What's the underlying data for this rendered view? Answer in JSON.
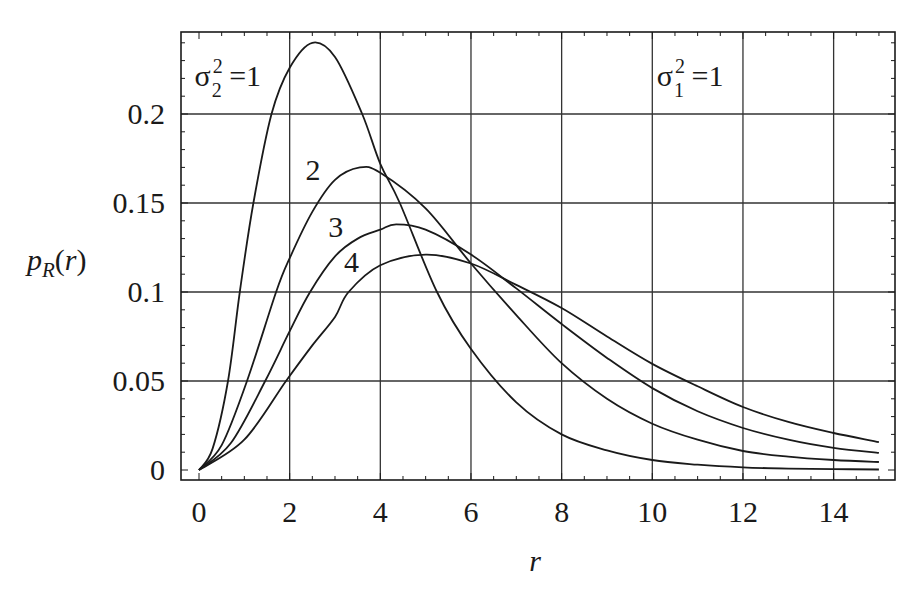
{
  "chart_data": {
    "type": "line",
    "title": "",
    "xlabel": "r",
    "ylabel": "p_R(r)",
    "ylabel_display": {
      "main": "p",
      "sub": "R",
      "suffix": "(r)"
    },
    "xlim": [
      -0.4,
      15.35
    ],
    "ylim": [
      -0.0056,
      0.246
    ],
    "grid": true,
    "legend": "none (inline curve labels)",
    "x_ticks": [
      0,
      2,
      4,
      6,
      8,
      10,
      12,
      14
    ],
    "x_tick_labels": [
      "0",
      "2",
      "4",
      "6",
      "8",
      "10",
      "12",
      "14"
    ],
    "y_ticks": [
      0,
      0.05,
      0.1,
      0.15,
      0.2
    ],
    "y_tick_labels": [
      "0",
      "0.05",
      "0.1",
      "0.15",
      "0.2"
    ],
    "annotations": [
      {
        "text": "σ₂² = 1",
        "base": "σ",
        "sub": "2",
        "sup": "2",
        "rest": " =1",
        "r": -0.1,
        "p": 0.216
      },
      {
        "text": "σ₁² = 1",
        "base": "σ",
        "sub": "1",
        "sup": "2",
        "rest": " =1",
        "r": 10.1,
        "p": 0.216
      },
      {
        "text": "2",
        "r": 2.35,
        "p": 0.163
      },
      {
        "text": "3",
        "r": 2.85,
        "p": 0.131
      },
      {
        "text": "4",
        "r": 3.2,
        "p": 0.111
      }
    ],
    "series": [
      {
        "name": "σ2² = 1",
        "label": "1",
        "x": [
          0,
          0.3,
          0.64,
          0.9,
          1.2,
          1.6,
          2.0,
          2.5,
          3.0,
          3.6,
          4.0,
          4.43,
          5.25,
          6.0,
          7.0,
          8.0,
          9.0,
          10.0,
          11.0,
          12.0,
          13.0,
          14.0,
          15.0
        ],
        "values": [
          0,
          0.012,
          0.05,
          0.1,
          0.15,
          0.2,
          0.226,
          0.24,
          0.232,
          0.2,
          0.172,
          0.15,
          0.1,
          0.068,
          0.038,
          0.02,
          0.011,
          0.0056,
          0.003,
          0.0015,
          0.0008,
          0.0005,
          0.0003
        ]
      },
      {
        "name": "σ2² = 2",
        "label": "2",
        "x": [
          0,
          0.5,
          1.06,
          1.7,
          2.0,
          2.5,
          3.0,
          3.55,
          4.0,
          5.0,
          6.0,
          7.0,
          8.0,
          9.0,
          10.0,
          11.0,
          12.0,
          13.0,
          14.0,
          15.0
        ],
        "values": [
          0,
          0.014,
          0.05,
          0.1,
          0.119,
          0.145,
          0.163,
          0.17,
          0.167,
          0.147,
          0.116,
          0.087,
          0.06,
          0.04,
          0.026,
          0.017,
          0.0107,
          0.0075,
          0.0056,
          0.0045
        ]
      },
      {
        "name": "σ2² = 3",
        "label": "3",
        "x": [
          0,
          0.7,
          1.46,
          2.0,
          2.45,
          3.0,
          3.5,
          4.0,
          4.35,
          5.0,
          6.0,
          7.0,
          8.0,
          9.0,
          10.0,
          11.0,
          12.0,
          13.0,
          14.0,
          15.0
        ],
        "values": [
          0,
          0.015,
          0.05,
          0.078,
          0.1,
          0.12,
          0.13,
          0.135,
          0.138,
          0.135,
          0.121,
          0.102,
          0.082,
          0.063,
          0.046,
          0.033,
          0.0236,
          0.017,
          0.0124,
          0.0096
        ]
      },
      {
        "name": "σ2² = 4",
        "label": "4",
        "x": [
          0,
          1.0,
          1.92,
          2.5,
          3.0,
          3.3,
          4.0,
          5.0,
          6.0,
          7.0,
          8.0,
          9.0,
          10.0,
          11.0,
          12.0,
          13.0,
          14.0,
          15.0
        ],
        "values": [
          0,
          0.017,
          0.05,
          0.07,
          0.086,
          0.1,
          0.115,
          0.121,
          0.116,
          0.104,
          0.091,
          0.075,
          0.0596,
          0.047,
          0.0354,
          0.027,
          0.0208,
          0.0157
        ]
      }
    ]
  },
  "layout": {
    "plot_box": {
      "left": 181,
      "top": 32,
      "right": 895,
      "bottom": 480
    },
    "x_origin_px": 199,
    "x_px_per_unit": 45.33,
    "y_origin_px": 470,
    "y_px_per_unit": 1780,
    "line_color": "#1a1a1a",
    "grid_color": "#333333",
    "background": "#ffffff"
  }
}
